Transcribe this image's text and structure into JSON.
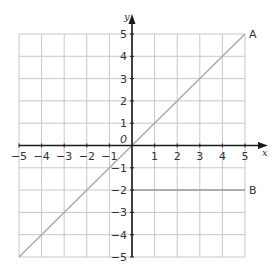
{
  "diagram": {
    "type": "coordinate-grid",
    "axes": {
      "x_label": "x",
      "y_label": "y",
      "x_min": -5,
      "x_max": 5,
      "y_min": -5,
      "y_max": 5,
      "x_ticks": [
        "-5",
        "-4",
        "-3",
        "-2",
        "-1",
        "1",
        "2",
        "3",
        "4",
        "5"
      ],
      "y_ticks": [
        "5",
        "4",
        "3",
        "2",
        "1",
        "-1",
        "-2",
        "-3",
        "-4",
        "-5"
      ],
      "origin_label": "0"
    },
    "lines": [
      {
        "label": "A",
        "description": "y = x",
        "from": [
          -5,
          -5
        ],
        "to": [
          5,
          5
        ]
      },
      {
        "label": "B",
        "description": "y = -2",
        "from": [
          0,
          -2
        ],
        "to": [
          5,
          -2
        ]
      }
    ],
    "colors": {
      "grid": "#c8c8c8",
      "axes": "#1a1a1a",
      "line_a": "#aaaaaa",
      "line_b": "#9a9a9a",
      "text": "#333333"
    }
  }
}
